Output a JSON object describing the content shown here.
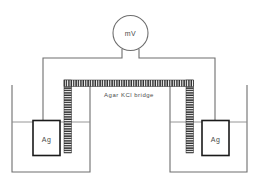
{
  "diagram": {
    "meter": {
      "label": "mV",
      "name": "millivolt-meter"
    },
    "salt_bridge": {
      "label": "Agar KCl  bridge"
    },
    "left_cell": {
      "electrode_label": "Ag"
    },
    "right_cell": {
      "electrode_label": "Ag"
    },
    "colors": {
      "outline": "#6e6e6e",
      "wire": "#6e6e6e",
      "electrode_outline": "#1a1a1a",
      "bridge_fill": "#2b2b2b",
      "bridge_inner": "#ffffff",
      "text": "#4a4a4a",
      "background": "#ffffff"
    }
  }
}
